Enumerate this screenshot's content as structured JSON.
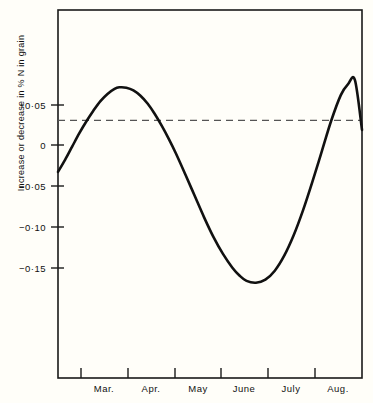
{
  "chart_data": {
    "type": "line",
    "title": "",
    "subtitle": "",
    "xlabel": "",
    "ylabel": "Increase or decrease in % N in grain",
    "x_tick_labels": [
      "Mar.",
      "Apr.",
      "May",
      "June",
      "July",
      "Aug."
    ],
    "y_tick_labels": [
      "+0·05",
      "0",
      "−0·05",
      "−0·10",
      "−0·15"
    ],
    "y_tick_values": [
      0.05,
      0,
      -0.05,
      -0.1,
      -0.15
    ],
    "ylim": [
      -0.215,
      0.092
    ],
    "xlim": [
      0,
      6.45
    ],
    "grid": false,
    "legend": null,
    "zero_reference_line": {
      "value": 0,
      "style": "dashed",
      "color": "#555555"
    },
    "series": [
      {
        "name": "Increase or decrease in % N in grain",
        "color": "#111111",
        "x": [
          0.0,
          0.15,
          0.3,
          0.45,
          0.6,
          0.75,
          0.9,
          1.05,
          1.2,
          1.3,
          1.45,
          1.6,
          1.75,
          1.9,
          2.05,
          2.2,
          2.35,
          2.5,
          2.7,
          2.9,
          3.1,
          3.3,
          3.5,
          3.7,
          3.85,
          4.0,
          4.2,
          4.4,
          4.6,
          4.8,
          5.0,
          5.2,
          5.4,
          5.6,
          5.8,
          6.0,
          6.15,
          6.3,
          6.45
        ],
        "y": [
          -0.043,
          -0.033,
          -0.022,
          -0.011,
          -0.001,
          0.008,
          0.016,
          0.022,
          0.0262,
          0.0275,
          0.0272,
          0.025,
          0.0205,
          0.014,
          0.0055,
          -0.0045,
          -0.0155,
          -0.0275,
          -0.045,
          -0.063,
          -0.081,
          -0.0975,
          -0.1115,
          -0.123,
          -0.1295,
          -0.134,
          -0.1355,
          -0.133,
          -0.1255,
          -0.113,
          -0.096,
          -0.075,
          -0.051,
          -0.0255,
          0.0,
          0.021,
          0.03,
          0.0335,
          -0.008
        ],
        "annotations": [
          {
            "label": "first maximum",
            "x": 1.32,
            "y": 0.0276
          },
          {
            "label": "minimum",
            "x": 4.18,
            "y": -0.1355
          },
          {
            "label": "second maximum",
            "x": 6.28,
            "y": 0.0336
          }
        ]
      }
    ],
    "axes_frame": {
      "left": 58,
      "right": 362,
      "top": 10,
      "bottom": 378,
      "x_tick_positions": [
        58,
        81,
        128,
        175,
        221,
        268,
        315,
        362
      ]
    }
  }
}
